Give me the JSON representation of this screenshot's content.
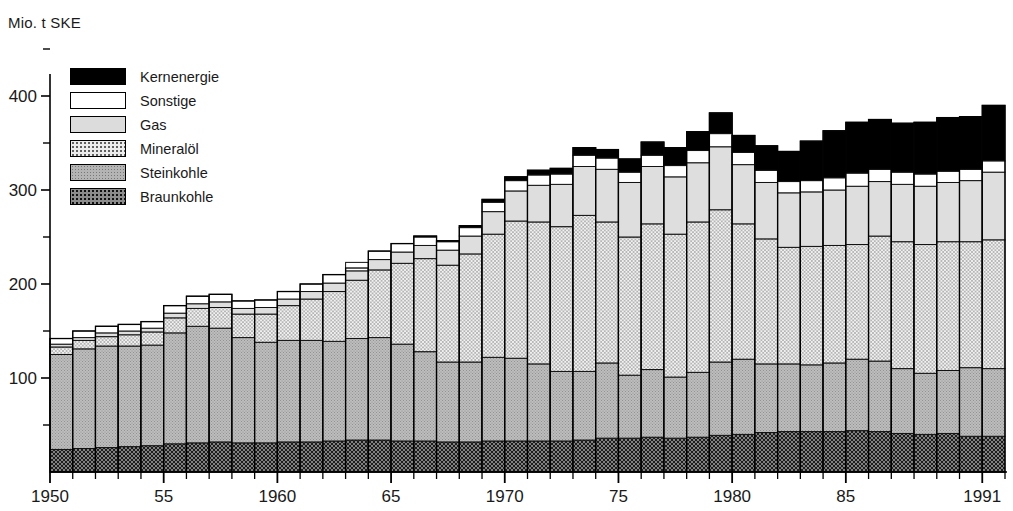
{
  "axis": {
    "y_unit_label": "Mio. t SKE",
    "y_ticks": [
      100,
      200,
      300,
      400
    ],
    "y_minor_ticks": [
      50,
      150,
      250,
      350,
      450
    ],
    "y_range": [
      0,
      460
    ],
    "x_tick_labels": [
      {
        "year": 1950,
        "text": "1950"
      },
      {
        "year": 1955,
        "text": "55"
      },
      {
        "year": 1960,
        "text": "1960"
      },
      {
        "year": 1965,
        "text": "65"
      },
      {
        "year": 1970,
        "text": "1970"
      },
      {
        "year": 1975,
        "text": "75"
      },
      {
        "year": 1980,
        "text": "1980"
      },
      {
        "year": 1985,
        "text": "85"
      },
      {
        "year": 1991,
        "text": "1991"
      }
    ]
  },
  "legend": {
    "position": "top-left-inside",
    "items": [
      {
        "label": "Kernenergie",
        "key": "kernenergie",
        "fill": "#000000"
      },
      {
        "label": "Sonstige",
        "key": "sonstige",
        "fill": "#ffffff"
      },
      {
        "label": "Gas",
        "key": "gas",
        "fill": "#dcdcdc"
      },
      {
        "label": "Mineralöl",
        "key": "mineraloel",
        "fill": "#ededed"
      },
      {
        "label": "Steinkohle",
        "key": "steinkohle",
        "fill": "#b4b4b4"
      },
      {
        "label": "Braunkohle",
        "key": "braunkohle",
        "fill": "#8c8c8c"
      }
    ]
  },
  "chart_data": {
    "type": "bar",
    "stacked": true,
    "title": "",
    "xlabel": "",
    "ylabel": "Mio. t SKE",
    "ylim": [
      0,
      460
    ],
    "grid": false,
    "categories": [
      1950,
      1951,
      1952,
      1953,
      1954,
      1955,
      1956,
      1957,
      1958,
      1959,
      1960,
      1961,
      1962,
      1963,
      1964,
      1965,
      1966,
      1967,
      1968,
      1969,
      1970,
      1971,
      1972,
      1973,
      1974,
      1975,
      1976,
      1977,
      1978,
      1979,
      1980,
      1981,
      1982,
      1983,
      1984,
      1985,
      1986,
      1987,
      1988,
      1989,
      1990,
      1991
    ],
    "series": [
      {
        "name": "Braunkohle",
        "key": "braunkohle",
        "fill": "#8c8c8c",
        "values": [
          24,
          25,
          26,
          27,
          28,
          30,
          31,
          32,
          31,
          31,
          32,
          32,
          33,
          34,
          34,
          33,
          33,
          32,
          32,
          33,
          33,
          33,
          33,
          34,
          36,
          36,
          37,
          36,
          37,
          39,
          40,
          42,
          43,
          43,
          43,
          44,
          43,
          41,
          40,
          41,
          38,
          38
        ]
      },
      {
        "name": "Steinkohle",
        "key": "steinkohle",
        "fill": "#b4b4b4",
        "values": [
          101,
          106,
          108,
          107,
          107,
          118,
          124,
          121,
          112,
          107,
          108,
          108,
          106,
          108,
          109,
          103,
          95,
          85,
          85,
          89,
          88,
          82,
          74,
          73,
          80,
          67,
          72,
          65,
          69,
          78,
          80,
          73,
          72,
          71,
          73,
          76,
          75,
          69,
          65,
          67,
          73,
          72
        ]
      },
      {
        "name": "Mineralöl",
        "key": "mineraloel",
        "fill": "#ededed",
        "values": [
          8,
          9,
          10,
          12,
          14,
          16,
          19,
          22,
          25,
          30,
          37,
          44,
          53,
          62,
          72,
          86,
          99,
          103,
          115,
          131,
          146,
          151,
          154,
          166,
          150,
          147,
          155,
          152,
          160,
          162,
          144,
          133,
          124,
          126,
          125,
          122,
          133,
          135,
          137,
          137,
          134,
          137
        ]
      },
      {
        "name": "Gas",
        "key": "gas",
        "fill": "#dcdcdc",
        "values": [
          3,
          3,
          4,
          4,
          4,
          5,
          5,
          6,
          6,
          7,
          7,
          8,
          9,
          10,
          11,
          12,
          14,
          16,
          19,
          24,
          32,
          39,
          45,
          52,
          56,
          58,
          61,
          61,
          63,
          67,
          63,
          60,
          58,
          58,
          59,
          62,
          58,
          61,
          62,
          63,
          65,
          72
        ]
      },
      {
        "name": "Sonstige",
        "key": "sonstige",
        "fill": "#ffffff",
        "values": [
          6,
          7,
          7,
          7,
          7,
          8,
          8,
          8,
          8,
          8,
          8,
          8,
          9,
          9,
          9,
          9,
          9,
          9,
          9,
          10,
          11,
          11,
          11,
          12,
          12,
          11,
          12,
          12,
          13,
          14,
          13,
          13,
          12,
          12,
          13,
          14,
          13,
          13,
          13,
          12,
          12,
          12
        ]
      },
      {
        "name": "Kernenergie",
        "key": "kernenergie",
        "fill": "#000000",
        "values": [
          0,
          0,
          0,
          0,
          0,
          0,
          0,
          0,
          0,
          0,
          0,
          0,
          0,
          0,
          0,
          0,
          1,
          1,
          2,
          3,
          4,
          5,
          6,
          8,
          9,
          14,
          14,
          19,
          20,
          22,
          18,
          26,
          32,
          42,
          50,
          54,
          53,
          52,
          55,
          57,
          56,
          59
        ]
      }
    ],
    "totals": [
      142,
      150,
      155,
      157,
      160,
      177,
      187,
      189,
      182,
      183,
      192,
      200,
      210,
      217,
      235,
      243,
      251,
      246,
      262,
      290,
      314,
      321,
      323,
      345,
      343,
      333,
      351,
      345,
      362,
      382,
      358,
      347,
      341,
      352,
      363,
      372,
      375,
      371,
      372,
      377,
      378,
      390
    ]
  }
}
